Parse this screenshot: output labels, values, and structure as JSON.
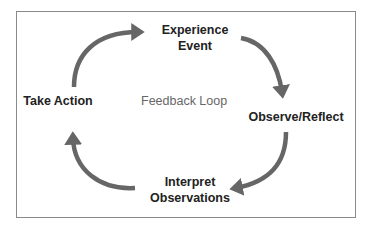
{
  "diagram": {
    "title": "Feedback Loop",
    "nodes": [
      {
        "id": "experience",
        "line1": "Experience",
        "line2": "Event"
      },
      {
        "id": "observe",
        "line1": "Observe/Reflect"
      },
      {
        "id": "interpret",
        "line1": "Interpret",
        "line2": "Observations"
      },
      {
        "id": "action",
        "line1": "Take Action"
      }
    ],
    "edges": [
      {
        "from": "action",
        "to": "experience"
      },
      {
        "from": "experience",
        "to": "observe"
      },
      {
        "from": "observe",
        "to": "interpret"
      },
      {
        "from": "interpret",
        "to": "action"
      }
    ],
    "arrow_color": "#666666",
    "border_color": "#8a8a8a"
  }
}
